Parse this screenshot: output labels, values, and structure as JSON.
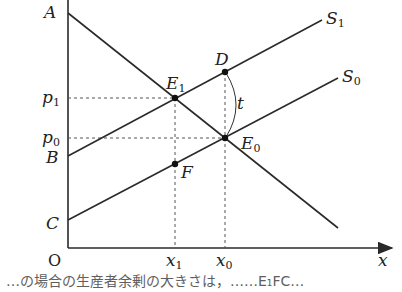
{
  "diagram": {
    "type": "supply-demand-tax",
    "axes": {
      "origin_label": "O",
      "x_label": "x"
    },
    "price_labels": {
      "p1": "p",
      "p1_sub": "1",
      "p0": "p",
      "p0_sub": "0"
    },
    "quantity_labels": {
      "x1": "x",
      "x1_sub": "1",
      "x0": "x",
      "x0_sub": "0"
    },
    "intercepts": {
      "A": "A",
      "B": "B",
      "C": "C"
    },
    "curves": {
      "S1": {
        "name": "S",
        "sub": "1"
      },
      "S0": {
        "name": "S",
        "sub": "0"
      }
    },
    "points": {
      "E1": {
        "name": "E",
        "sub": "1"
      },
      "E0": {
        "name": "E",
        "sub": "0"
      },
      "D": {
        "name": "D"
      },
      "F": {
        "name": "F"
      }
    },
    "tax_label": "t",
    "colors": {
      "line": "#2a2a2a",
      "dashed": "#555555"
    }
  },
  "caption": "…の場合の生産者余剰の大きさは，……E₁FC…"
}
